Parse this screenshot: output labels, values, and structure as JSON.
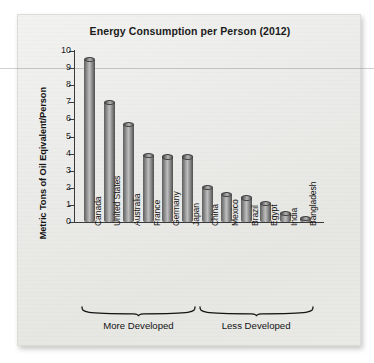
{
  "chart_data": {
    "type": "bar",
    "title": "Energy Consumption per Person (2012)",
    "xlabel": "",
    "ylabel": "Metric Tons of Oil Eqivalent/Person",
    "ylim": [
      0,
      10
    ],
    "yticks": [
      "0",
      "1",
      "2",
      "3",
      "4",
      "5",
      "6",
      "7",
      "8",
      "9",
      "10"
    ],
    "grid": false,
    "legend": "none",
    "categories": [
      "Canada",
      "United States",
      "Australia",
      "France",
      "Germany",
      "Japan",
      "China",
      "Mexico",
      "Brazil",
      "Egypt",
      "India",
      "Bangladesh"
    ],
    "values": [
      9.5,
      7.0,
      5.7,
      3.9,
      3.8,
      3.8,
      2.0,
      1.6,
      1.4,
      1.1,
      0.5,
      0.2
    ],
    "groups": [
      {
        "label": "More Developed",
        "categories": [
          "Canada",
          "United States",
          "Australia",
          "France",
          "Germany",
          "Japan"
        ]
      },
      {
        "label": "Less Developed",
        "categories": [
          "China",
          "Mexico",
          "Brazil",
          "Egypt",
          "India",
          "Bangladesh"
        ]
      }
    ],
    "bar_style": "3d-cylinder",
    "bar_color": "#8f8f8f"
  },
  "page": {
    "background_color": "#ebebe9",
    "ink_color": "#141414"
  }
}
